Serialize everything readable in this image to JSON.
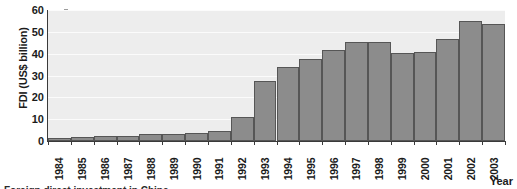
{
  "chart_data": {
    "type": "bar",
    "title": "",
    "xlabel": "Year",
    "ylabel": "FDI (US$ billion)",
    "categories": [
      "1984",
      "1985",
      "1986",
      "1987",
      "1988",
      "1989",
      "1990",
      "1991",
      "1992",
      "1993",
      "1994",
      "1995",
      "1996",
      "1997",
      "1998",
      "1999",
      "2000",
      "2001",
      "2002",
      "2003"
    ],
    "values": [
      1.3,
      2.0,
      2.2,
      2.3,
      3.2,
      3.4,
      3.5,
      4.4,
      11.0,
      27.5,
      33.8,
      37.5,
      41.7,
      45.3,
      45.5,
      40.3,
      40.8,
      46.8,
      55.0,
      53.5
    ],
    "ylim": [
      0,
      60
    ],
    "yticks": [
      0,
      10,
      20,
      30,
      40,
      50,
      60
    ],
    "ytick_labels": [
      "0",
      "10",
      "20",
      "30",
      "40",
      "50",
      "60"
    ],
    "grid": true,
    "grid_axis": "y",
    "legend": "none",
    "bar_color": "#8c8c8c",
    "bar_edge_color": "#565656",
    "plot_background": "#ededed",
    "gridline_color": "#fbfbfb",
    "axis_color": "#3a3a3a",
    "text_color": "#1b1b1b"
  },
  "caption": {
    "partial_text": "Foreign direct investment in China"
  }
}
